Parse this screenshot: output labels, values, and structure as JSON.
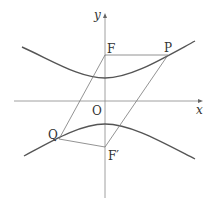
{
  "diagram": {
    "type": "hyperbola-parallelogram",
    "axes": {
      "x_label": "x",
      "y_label": "y",
      "origin_label": "O"
    },
    "points": {
      "F": {
        "label": "F"
      },
      "F_prime": {
        "label": "F′"
      },
      "P": {
        "label": "P"
      },
      "Q": {
        "label": "Q"
      }
    },
    "colors": {
      "curve": "#555555",
      "line": "#777777",
      "text": "#333333"
    }
  }
}
